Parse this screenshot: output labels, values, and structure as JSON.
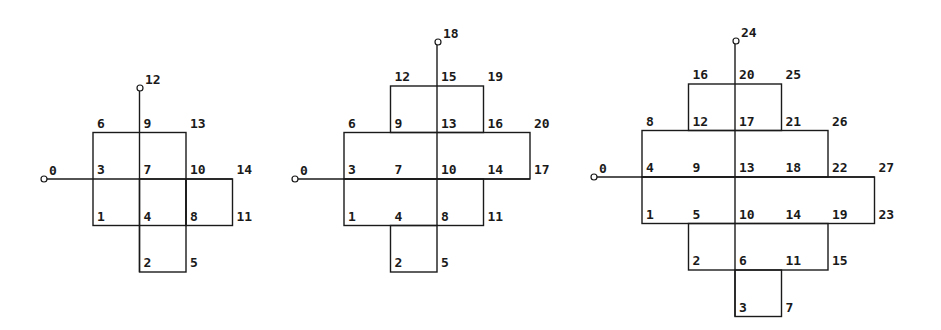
{
  "cell_size": 46.5,
  "colors": {
    "line": "#1a1a1a",
    "text": "#1a1a1a",
    "background": "#ffffff"
  },
  "diagrams": [
    {
      "name": "diagram-small",
      "origin_x": 93,
      "origin_y": 179,
      "cells": [
        [
          0,
          -1
        ],
        [
          1,
          -1
        ],
        [
          0,
          0
        ],
        [
          1,
          0
        ],
        [
          2,
          -0.01
        ],
        [
          1,
          1
        ]
      ],
      "rects": [
        {
          "c0": 0,
          "r0": -1,
          "c1": 2,
          "r1": 1
        },
        {
          "c0": 1,
          "r0": 0,
          "c1": 2,
          "r1": 2
        },
        {
          "c0": 2,
          "r0": 0,
          "c1": 3,
          "r1": 1
        }
      ],
      "axis_h": {
        "x_from": 44,
        "to_col": 3,
        "row": 0
      },
      "axis_v": {
        "col": 1,
        "y_from": 88,
        "to_row": 2
      },
      "dots": [
        {
          "x": 44,
          "y": 179,
          "label": "0"
        },
        {
          "x": 140,
          "y": 88,
          "label": "12"
        }
      ],
      "labels": [
        {
          "col": 0,
          "row": -1,
          "text": "6"
        },
        {
          "col": 1,
          "row": -1,
          "text": "9"
        },
        {
          "col": 2,
          "row": -1,
          "text": "13"
        },
        {
          "col": 0,
          "row": 0,
          "text": "3"
        },
        {
          "col": 1,
          "row": 0,
          "text": "7"
        },
        {
          "col": 2,
          "row": 0,
          "text": "10"
        },
        {
          "col": 3,
          "row": 0,
          "text": "14"
        },
        {
          "col": 0,
          "row": 1,
          "text": "1"
        },
        {
          "col": 1,
          "row": 1,
          "text": "4"
        },
        {
          "col": 2,
          "row": 1,
          "text": "8"
        },
        {
          "col": 3,
          "row": 1,
          "text": "11"
        },
        {
          "col": 1,
          "row": 2,
          "text": "2"
        },
        {
          "col": 2,
          "row": 2,
          "text": "5"
        }
      ]
    },
    {
      "name": "diagram-medium",
      "origin_x": 344,
      "origin_y": 179,
      "rects": [
        {
          "c0": 1,
          "r0": -2,
          "c1": 3,
          "r1": -1
        },
        {
          "c0": 0,
          "r0": -1,
          "c1": 4,
          "r1": 0
        },
        {
          "c0": 0,
          "r0": 0,
          "c1": 3,
          "r1": 1
        },
        {
          "c0": 1,
          "r0": 1,
          "c1": 2,
          "r1": 2
        }
      ],
      "axis_h": {
        "x_from": 295,
        "to_col": 4,
        "row": 0
      },
      "axis_v": {
        "col": 2,
        "y_from": 42,
        "to_row": 1
      },
      "dots": [
        {
          "x": 295,
          "y": 179,
          "label": "0"
        },
        {
          "x": 438,
          "y": 42,
          "label": "18"
        }
      ],
      "labels": [
        {
          "col": 1,
          "row": -2,
          "text": "12"
        },
        {
          "col": 2,
          "row": -2,
          "text": "15"
        },
        {
          "col": 3,
          "row": -2,
          "text": "19"
        },
        {
          "col": 0,
          "row": -1,
          "text": "6"
        },
        {
          "col": 1,
          "row": -1,
          "text": "9"
        },
        {
          "col": 2,
          "row": -1,
          "text": "13"
        },
        {
          "col": 3,
          "row": -1,
          "text": "16"
        },
        {
          "col": 4,
          "row": -1,
          "text": "20"
        },
        {
          "col": 0,
          "row": 0,
          "text": "3"
        },
        {
          "col": 1,
          "row": 0,
          "text": "7"
        },
        {
          "col": 2,
          "row": 0,
          "text": "10"
        },
        {
          "col": 3,
          "row": 0,
          "text": "14"
        },
        {
          "col": 4,
          "row": 0,
          "text": "17"
        },
        {
          "col": 0,
          "row": 1,
          "text": "1"
        },
        {
          "col": 1,
          "row": 1,
          "text": "4"
        },
        {
          "col": 2,
          "row": 1,
          "text": "8"
        },
        {
          "col": 3,
          "row": 1,
          "text": "11"
        },
        {
          "col": 1,
          "row": 2,
          "text": "2"
        },
        {
          "col": 2,
          "row": 2,
          "text": "5"
        }
      ]
    },
    {
      "name": "diagram-large",
      "origin_x": 642,
      "origin_y": 177,
      "rects": [
        {
          "c0": 1,
          "r0": -2,
          "c1": 3,
          "r1": -1
        },
        {
          "c0": 0,
          "r0": -1,
          "c1": 4,
          "r1": 0
        },
        {
          "c0": 0,
          "r0": 0,
          "c1": 5,
          "r1": 1
        },
        {
          "c0": 1,
          "r0": 1,
          "c1": 4,
          "r1": 2
        },
        {
          "c0": 2,
          "r0": 2,
          "c1": 3,
          "r1": 3
        }
      ],
      "axis_h": {
        "x_from": 594,
        "to_col": 5,
        "row": 0
      },
      "axis_v": {
        "col": 2,
        "y_from": 41,
        "to_row": 3
      },
      "dots": [
        {
          "x": 594,
          "y": 177,
          "label": "0"
        },
        {
          "x": 736,
          "y": 41,
          "label": "24"
        }
      ],
      "labels": [
        {
          "col": 1,
          "row": -2,
          "text": "16"
        },
        {
          "col": 2,
          "row": -2,
          "text": "20"
        },
        {
          "col": 3,
          "row": -2,
          "text": "25"
        },
        {
          "col": 0,
          "row": -1,
          "text": "8"
        },
        {
          "col": 1,
          "row": -1,
          "text": "12"
        },
        {
          "col": 2,
          "row": -1,
          "text": "17"
        },
        {
          "col": 3,
          "row": -1,
          "text": "21"
        },
        {
          "col": 4,
          "row": -1,
          "text": "26"
        },
        {
          "col": 0,
          "row": 0,
          "text": "4"
        },
        {
          "col": 1,
          "row": 0,
          "text": "9"
        },
        {
          "col": 2,
          "row": 0,
          "text": "13"
        },
        {
          "col": 3,
          "row": 0,
          "text": "18"
        },
        {
          "col": 4,
          "row": 0,
          "text": "22"
        },
        {
          "col": 5,
          "row": 0,
          "text": "27"
        },
        {
          "col": 0,
          "row": 1,
          "text": "1"
        },
        {
          "col": 1,
          "row": 1,
          "text": "5"
        },
        {
          "col": 2,
          "row": 1,
          "text": "10"
        },
        {
          "col": 3,
          "row": 1,
          "text": "14"
        },
        {
          "col": 4,
          "row": 1,
          "text": "19"
        },
        {
          "col": 5,
          "row": 1,
          "text": "23"
        },
        {
          "col": 1,
          "row": 2,
          "text": "2"
        },
        {
          "col": 2,
          "row": 2,
          "text": "6"
        },
        {
          "col": 3,
          "row": 2,
          "text": "11"
        },
        {
          "col": 4,
          "row": 2,
          "text": "15"
        },
        {
          "col": 2,
          "row": 3,
          "text": "3"
        },
        {
          "col": 3,
          "row": 3,
          "text": "7"
        }
      ]
    }
  ]
}
